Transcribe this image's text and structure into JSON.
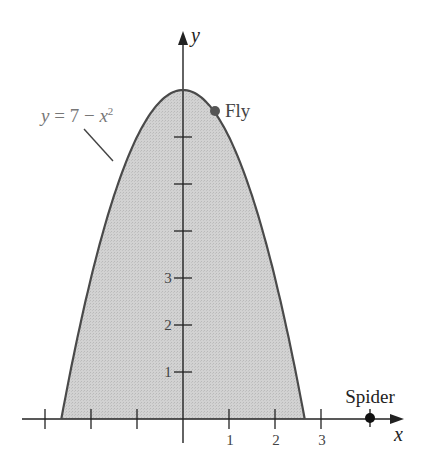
{
  "figure": {
    "equation_label": "y = 7 − x²",
    "eq_y": "y",
    "eq_mid": " = 7 − ",
    "eq_x": "x",
    "eq_sup": "2",
    "x_axis_label": "x",
    "y_axis_label": "y",
    "fly_label": "Fly",
    "spider_label": "Spider",
    "x_tick_labels": [
      "1",
      "2",
      "3"
    ],
    "y_tick_labels": [
      "1",
      "2",
      "3"
    ],
    "colors": {
      "region_fill": "#cfcfcf",
      "curve": "#4a4a4a",
      "axis": "#222222",
      "fly_dot": "#555555",
      "spider_dot": "#111111",
      "equation_text": "#777777"
    }
  },
  "chart_data": {
    "type": "area",
    "title": "",
    "function": "y = 7 - x^2",
    "shaded_region": "area under y = 7 - x^2 above x-axis, x from -sqrt(7) to sqrt(7)",
    "x_ticks": [
      -3,
      -2,
      -1,
      0,
      1,
      2,
      3
    ],
    "x_tick_labels": [
      "1",
      "2",
      "3"
    ],
    "y_ticks": [
      1,
      2,
      3,
      4,
      5,
      6,
      7
    ],
    "y_tick_labels": [
      "1",
      "2",
      "3"
    ],
    "xlabel": "x",
    "ylabel": "y",
    "points": [
      {
        "name": "Fly",
        "x": 0.7,
        "y": 6.5
      },
      {
        "name": "Spider",
        "x": 4,
        "y": 0
      }
    ],
    "xlim": [
      -3.4,
      4.6
    ],
    "ylim": [
      -0.5,
      7.8
    ]
  }
}
